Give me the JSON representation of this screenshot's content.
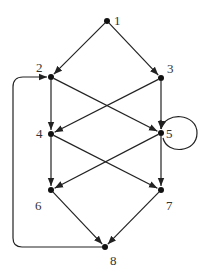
{
  "diagram": {
    "type": "directed-graph",
    "nodes": [
      {
        "id": "1",
        "label": "1",
        "x": 107,
        "y": 21,
        "lx": 114,
        "ly": 25
      },
      {
        "id": "2",
        "label": "2",
        "x": 51,
        "y": 77,
        "lx": 36,
        "ly": 72
      },
      {
        "id": "3",
        "label": "3",
        "x": 161,
        "y": 78,
        "lx": 167,
        "ly": 73
      },
      {
        "id": "4",
        "label": "4",
        "x": 51,
        "y": 134,
        "lx": 36,
        "ly": 138
      },
      {
        "id": "5",
        "label": "5",
        "x": 161,
        "y": 133,
        "lx": 166,
        "ly": 138
      },
      {
        "id": "6",
        "label": "6",
        "x": 51,
        "y": 190,
        "lx": 35,
        "ly": 210
      },
      {
        "id": "7",
        "label": "7",
        "x": 161,
        "y": 190,
        "lx": 166,
        "ly": 210
      },
      {
        "id": "8",
        "label": "8",
        "x": 105,
        "y": 247,
        "lx": 110,
        "ly": 265
      }
    ],
    "edges": [
      {
        "from": "1",
        "to": "2"
      },
      {
        "from": "1",
        "to": "3"
      },
      {
        "from": "2",
        "to": "4"
      },
      {
        "from": "2",
        "to": "5"
      },
      {
        "from": "3",
        "to": "4"
      },
      {
        "from": "3",
        "to": "5"
      },
      {
        "from": "4",
        "to": "6"
      },
      {
        "from": "4",
        "to": "7"
      },
      {
        "from": "5",
        "to": "6"
      },
      {
        "from": "5",
        "to": "7"
      },
      {
        "from": "5",
        "to": "5",
        "kind": "self-loop"
      },
      {
        "from": "6",
        "to": "8"
      },
      {
        "from": "7",
        "to": "8"
      },
      {
        "from": "8",
        "to": "2",
        "kind": "back-edge"
      }
    ]
  }
}
